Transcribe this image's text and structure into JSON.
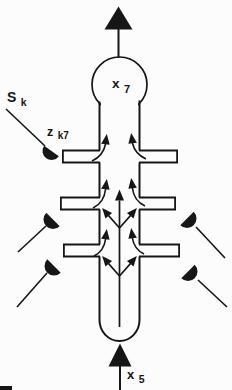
{
  "colors": {
    "ink": "#161616",
    "paper": "#fcfcfc"
  },
  "diagram": {
    "labels": {
      "presynaptic_signal": {
        "base": "S",
        "sub": "k"
      },
      "synaptic_weight": {
        "base": "z",
        "sub": "k7"
      },
      "soma_output": {
        "base": "x",
        "sub": "7"
      },
      "dendrite_input": {
        "base": "x",
        "sub": "5"
      }
    }
  }
}
